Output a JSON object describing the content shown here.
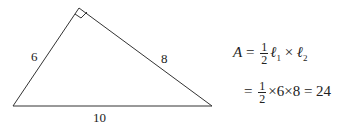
{
  "diagram": {
    "shape": "right-triangle",
    "right_angle_marker": true,
    "sides": [
      {
        "name": "leg-1",
        "label": "6"
      },
      {
        "name": "leg-2",
        "label": "8"
      },
      {
        "name": "hypotenuse",
        "label": "10"
      }
    ]
  },
  "equation": {
    "line1": {
      "lhs": "A",
      "eq": "=",
      "num": "1",
      "den": "2",
      "ell": "ℓ",
      "sub1": "1",
      "times": "×",
      "sub2": "2"
    },
    "line2": {
      "eq": "=",
      "num": "1",
      "den": "2",
      "rest": "×6×8 = 24"
    }
  }
}
